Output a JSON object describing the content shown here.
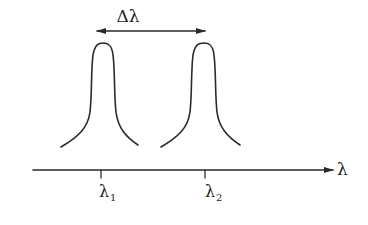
{
  "diagram": {
    "type": "spectral-resolution",
    "colors": {
      "line": "#2a2a2a",
      "text": "#222222",
      "background": "#ffffff"
    },
    "separation_label": "Δλ",
    "axis": {
      "label": "λ",
      "ticks": [
        {
          "label_main": "λ",
          "label_sub": "1"
        },
        {
          "label_main": "λ",
          "label_sub": "2"
        }
      ]
    },
    "peaks": [
      {
        "name": "peak-1",
        "center_tick": "λ1"
      },
      {
        "name": "peak-2",
        "center_tick": "λ2"
      }
    ]
  }
}
